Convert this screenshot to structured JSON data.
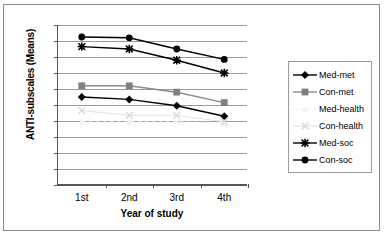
{
  "chart_data": {
    "type": "line",
    "title": "",
    "xlabel": "Year of study",
    "ylabel": "ANTI-subscales (Means)",
    "categories": [
      "1st",
      "2nd",
      "3rd",
      "4th"
    ],
    "ylim": [
      0,
      20
    ],
    "yticks": [
      0,
      2,
      4,
      6,
      8,
      10,
      12,
      14,
      16,
      18,
      20
    ],
    "grid": true,
    "legend_position": "right",
    "series": [
      {
        "name": "Med-met",
        "values": [
          11.0,
          10.7,
          9.9,
          8.6
        ],
        "color": "#000000",
        "marker": "diamond",
        "marker_color": "#000000"
      },
      {
        "name": "Con-met",
        "values": [
          12.4,
          12.4,
          11.6,
          10.3
        ],
        "color": "#8c8c8c",
        "marker": "square",
        "marker_color": "#808080"
      },
      {
        "name": "Med-health",
        "values": [
          7.9,
          7.9,
          7.9,
          7.8
        ],
        "color": "#eeeeee",
        "marker": "triangle",
        "marker_color": "#f4f4f4"
      },
      {
        "name": "Con-health",
        "values": [
          9.3,
          8.7,
          8.7,
          7.9
        ],
        "color": "#e3e3e3",
        "marker": "cross",
        "marker_color": "#dcdcdc"
      },
      {
        "name": "Med-soc",
        "values": [
          17.3,
          17.0,
          15.6,
          14.0
        ],
        "color": "#000000",
        "marker": "star",
        "marker_color": "#000000"
      },
      {
        "name": "Con-soc",
        "values": [
          18.5,
          18.4,
          17.0,
          15.7
        ],
        "color": "#000000",
        "marker": "circle",
        "marker_color": "#000000"
      }
    ]
  },
  "axes": {
    "y_title": "ANTI-subscales (Means)",
    "x_title": "Year of study",
    "y_tick_labels": [
      "20",
      "18",
      "16",
      "14",
      "12",
      "10",
      "8",
      "6",
      "4",
      "2",
      "0"
    ],
    "x_tick_labels": [
      "1st",
      "2nd",
      "3rd",
      "4th"
    ]
  },
  "legend": {
    "entries": [
      {
        "label": "Med-met"
      },
      {
        "label": "Con-met"
      },
      {
        "label": "Med-health"
      },
      {
        "label": "Con-health"
      },
      {
        "label": "Med-soc"
      },
      {
        "label": "Con-soc"
      }
    ]
  }
}
